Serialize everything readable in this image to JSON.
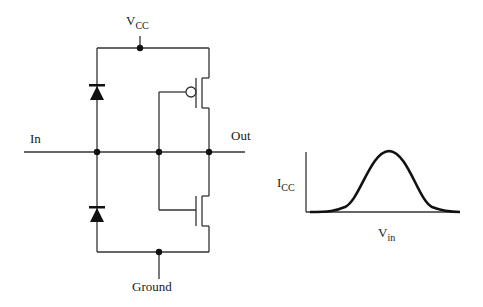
{
  "circuit": {
    "supply_label": "V",
    "supply_sub": "CC",
    "input_label": "In",
    "output_label": "Out",
    "ground_label": "Ground",
    "components": [
      "upper clamp diode",
      "lower clamp diode",
      "PMOS transistor",
      "NMOS transistor"
    ]
  },
  "graph": {
    "ylabel_main": "I",
    "ylabel_sub": "CC",
    "xlabel_main": "V",
    "xlabel_sub": "in"
  },
  "colors": {
    "line": "#333333",
    "fill": "#111111",
    "background": "#ffffff"
  }
}
